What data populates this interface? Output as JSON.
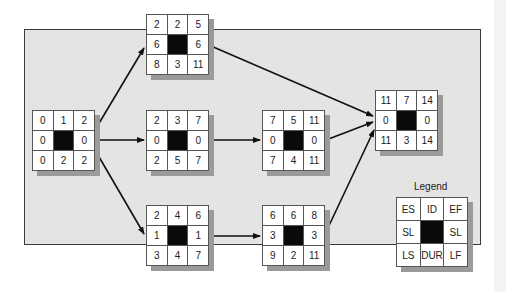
{
  "diagram": {
    "type": "activity-on-node network (critical path)",
    "nodes": [
      {
        "id": "start",
        "ES": "0",
        "ID": "1",
        "EF": "2",
        "SL_left": "0",
        "SL_right": "0",
        "LS": "0",
        "DUR": "2",
        "LF": "2"
      },
      {
        "id": "upper",
        "ES": "2",
        "ID": "2",
        "EF": "5",
        "SL_left": "6",
        "SL_right": "6",
        "LS": "8",
        "DUR": "3",
        "LF": "11"
      },
      {
        "id": "middle",
        "ES": "2",
        "ID": "3",
        "EF": "7",
        "SL_left": "0",
        "SL_right": "0",
        "LS": "2",
        "DUR": "5",
        "LF": "7"
      },
      {
        "id": "lower",
        "ES": "2",
        "ID": "4",
        "EF": "6",
        "SL_left": "1",
        "SL_right": "1",
        "LS": "3",
        "DUR": "4",
        "LF": "7"
      },
      {
        "id": "mid-right",
        "ES": "7",
        "ID": "5",
        "EF": "11",
        "SL_left": "0",
        "SL_right": "0",
        "LS": "7",
        "DUR": "4",
        "LF": "11"
      },
      {
        "id": "low-right",
        "ES": "6",
        "ID": "6",
        "EF": "8",
        "SL_left": "3",
        "SL_right": "3",
        "LS": "9",
        "DUR": "2",
        "LF": "11"
      },
      {
        "id": "end",
        "ES": "11",
        "ID": "7",
        "EF": "14",
        "SL_left": "0",
        "SL_right": "0",
        "LS": "11",
        "DUR": "3",
        "LF": "14"
      }
    ],
    "edges": [
      {
        "from": "1",
        "to": "2"
      },
      {
        "from": "1",
        "to": "3"
      },
      {
        "from": "1",
        "to": "4"
      },
      {
        "from": "2",
        "to": "7"
      },
      {
        "from": "3",
        "to": "5"
      },
      {
        "from": "4",
        "to": "6"
      },
      {
        "from": "5",
        "to": "7"
      },
      {
        "from": "6",
        "to": "7"
      }
    ],
    "legend": {
      "title": "Legend",
      "ES": "ES",
      "ID": "ID",
      "EF": "EF",
      "SL_left": "SL",
      "SL_right": "SL",
      "LS": "LS",
      "DUR": "DUR",
      "LF": "LF"
    },
    "colors": {
      "panel_bg": "#e4e4e4",
      "center_cell": "#0a0a0a",
      "shadow": "#9a9a9a",
      "arrow": "#111111"
    }
  }
}
